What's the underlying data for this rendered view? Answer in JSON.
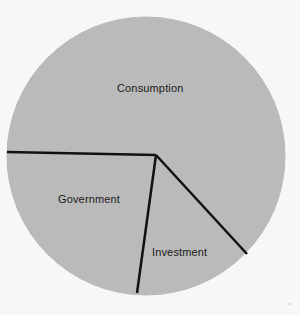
{
  "figure": {
    "background_color": "#f7f7f7",
    "width": 300,
    "height": 315
  },
  "chart_data": {
    "type": "pie",
    "title": "",
    "subtitle": "",
    "xlabel": "",
    "ylabel": "",
    "legend_position": "none",
    "grid": false,
    "labels_inside_slices": true,
    "slice_fill_color": "#b8b8b8",
    "slice_border_color": "#111111",
    "slice_border_width": 2.5,
    "outline_color": "#b8b8b8",
    "center": {
      "x": 146,
      "y": 156
    },
    "radius": 139,
    "vertex": {
      "x": 156,
      "y": 155
    },
    "categories": [
      "Consumption",
      "Government",
      "Investment"
    ],
    "values": [
      58,
      24,
      18
    ],
    "value_unit": "percent",
    "slices": [
      {
        "label": "Consumption",
        "value": 58,
        "start_angle_deg": 181,
        "end_angle_deg": 331,
        "sweep_deg": 210,
        "fill": "#b8b8b8",
        "label_position": {
          "x": 117,
          "y": 83
        }
      },
      {
        "label": "Government",
        "value": 24,
        "start_angle_deg": 96,
        "end_angle_deg": 181,
        "sweep_deg": 85,
        "fill": "#b8b8b8",
        "label_position": {
          "x": 58,
          "y": 194
        }
      },
      {
        "label": "Investment",
        "value": 18,
        "start_angle_deg": 331,
        "end_angle_deg": 96,
        "sweep_deg": 65,
        "fill": "#b8b8b8",
        "label_position": {
          "x": 152,
          "y": 247
        }
      }
    ],
    "boundary_lines": [
      {
        "name": "consumption-government-divider",
        "x1": 7,
        "y1": 152,
        "x2": 156,
        "y2": 155
      },
      {
        "name": "government-investment-divider",
        "x1": 156,
        "y1": 155,
        "x2": 137,
        "y2": 293
      },
      {
        "name": "investment-consumption-divider",
        "x1": 156,
        "y1": 155,
        "x2": 247,
        "y2": 254
      }
    ]
  },
  "labels": {
    "consumption": "Consumption",
    "government": "Government",
    "investment": "Investment"
  }
}
